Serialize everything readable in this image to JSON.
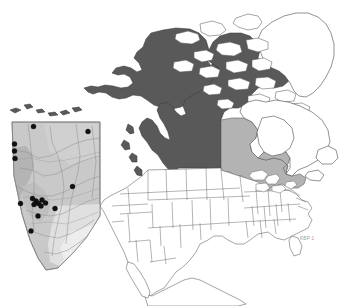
{
  "figure": {
    "credit_label": "KBP 1",
    "background_color": "#ffffff"
  },
  "legend_colors": {
    "range_core": "#595959",
    "range_secondary": "#b3b3b3",
    "non_range": "#ffffff",
    "coastline": "#4a4a4a",
    "occurrence_dot": "#111111",
    "inset_land": "#c9c9c9",
    "inset_frame": "#7a7a7a"
  },
  "main_map": {
    "name": "north-america-base-map",
    "projection_hint": "polar-ish conic, North America",
    "shaded_core_regions": [
      "Alaska",
      "Yukon",
      "Northwest Territories",
      "British Columbia",
      "Alberta"
    ],
    "shaded_secondary_regions": [
      "Saskatchewan",
      "Manitoba",
      "Ontario",
      "Quebec (southern)"
    ],
    "unshaded_regions": [
      "Greenland",
      "Canadian Arctic Archipelago",
      "United States (lower 48)",
      "Mexico"
    ]
  },
  "inset_map": {
    "name": "alberta-inset",
    "region_label": "Alberta",
    "frame": {
      "x": 10,
      "y": 120,
      "width": 92,
      "height": 152
    },
    "occurrence_count": 17,
    "occurrence_points": [
      {
        "id": 1,
        "x": 33.5,
        "y": 126.5
      },
      {
        "id": 2,
        "x": 88.0,
        "y": 131.5
      },
      {
        "id": 3,
        "x": 14.5,
        "y": 144.0
      },
      {
        "id": 4,
        "x": 14.5,
        "y": 151.0
      },
      {
        "id": 5,
        "x": 15.0,
        "y": 158.5
      },
      {
        "id": 6,
        "x": 72.5,
        "y": 186.5
      },
      {
        "id": 7,
        "x": 20.5,
        "y": 203.5
      },
      {
        "id": 8,
        "x": 32.5,
        "y": 198.5
      },
      {
        "id": 9,
        "x": 36.0,
        "y": 201.0
      },
      {
        "id": 10,
        "x": 38.5,
        "y": 203.5
      },
      {
        "id": 11,
        "x": 34.0,
        "y": 204.5
      },
      {
        "id": 12,
        "x": 42.0,
        "y": 200.0
      },
      {
        "id": 13,
        "x": 45.5,
        "y": 203.0
      },
      {
        "id": 14,
        "x": 41.0,
        "y": 206.0
      },
      {
        "id": 15,
        "x": 55.0,
        "y": 208.5
      },
      {
        "id": 16,
        "x": 38.0,
        "y": 216.0
      },
      {
        "id": 17,
        "x": 31.0,
        "y": 231.0
      }
    ]
  }
}
